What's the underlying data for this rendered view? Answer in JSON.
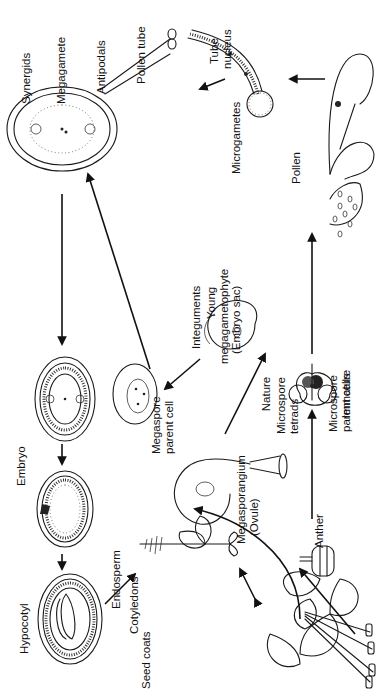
{
  "diagram": {
    "orientation": "rotated 90° counter-clockwise",
    "labels": {
      "anther": "Anther",
      "immature": "Immature",
      "nature": "Nature",
      "microspore_parent_cells_1": "Microspore",
      "microspore_parent_cells_2": "parent cells",
      "microspore_tetrads_1": "Microspore",
      "microspore_tetrads_2": "tetrads",
      "pollen": "Pollen",
      "tube_nucleus_1": "Tube",
      "tube_nucleus_2": "nucleus",
      "microgametes": "Microgametes",
      "pollen_tube": "Pollen tube",
      "antipodals": "Antipodals",
      "megagamete": "Megagamete",
      "synergids": "Synergids",
      "young_megagametophyte_1": "Young",
      "young_megagametophyte_2": "megagametophyte",
      "young_megagametophyte_3": "(Embryo sac)",
      "integuments": "Integuments",
      "megaspore_parent_cell_1": "Megaspore",
      "megaspore_parent_cell_2": "parent cell",
      "megasporangium_1": "Megasporangium",
      "megasporangium_2": "(Ovule)",
      "embryo": "Embryo",
      "seed_coats": "Seed coats",
      "endosperm": "Endosperm",
      "cotyledons": "Cotyledons",
      "hypocotyl": "Hypocotyl"
    },
    "stages": [
      "flower",
      "anther",
      "microsporangium",
      "pollen-sac",
      "germinating-pollen",
      "megasporangium",
      "young-megagametophyte",
      "developing-embryo-sac",
      "mature-embryo-sac",
      "fertilized-ovule",
      "ovule-with-embryo",
      "seed",
      "seedling"
    ]
  }
}
